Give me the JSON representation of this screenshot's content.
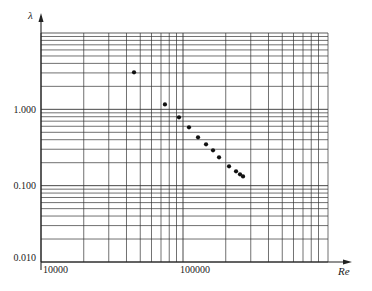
{
  "chart_data": {
    "type": "scatter",
    "title": "",
    "xlabel": "Re",
    "ylabel": "λ",
    "xscale": "log",
    "yscale": "log",
    "xlim": [
      10000,
      1000000
    ],
    "ylim": [
      0.01,
      10
    ],
    "grid": true,
    "legend": null,
    "x_tick_labels": [
      "10000",
      "100000"
    ],
    "y_tick_labels": [
      "1.000",
      "0.100",
      "0.010"
    ],
    "series": [
      {
        "name": "λ vs Re",
        "x": [
          45200,
          74600,
          93700,
          110200,
          127600,
          145300,
          162700,
          179400,
          211000,
          236300,
          252000,
          264700
        ],
        "y": [
          3.05,
          1.16,
          0.786,
          0.581,
          0.43,
          0.348,
          0.29,
          0.235,
          0.179,
          0.154,
          0.141,
          0.132
        ]
      }
    ]
  },
  "labels": {
    "y_axis_title": "λ",
    "x_axis_title": "Re",
    "y_1": "1.000",
    "y_01": "0.100",
    "y_001": "0.010",
    "x_1e4": "10000",
    "x_1e5": "100000"
  },
  "colors": {
    "grid": "#333333",
    "point": "#111111",
    "axis": "#222222"
  }
}
